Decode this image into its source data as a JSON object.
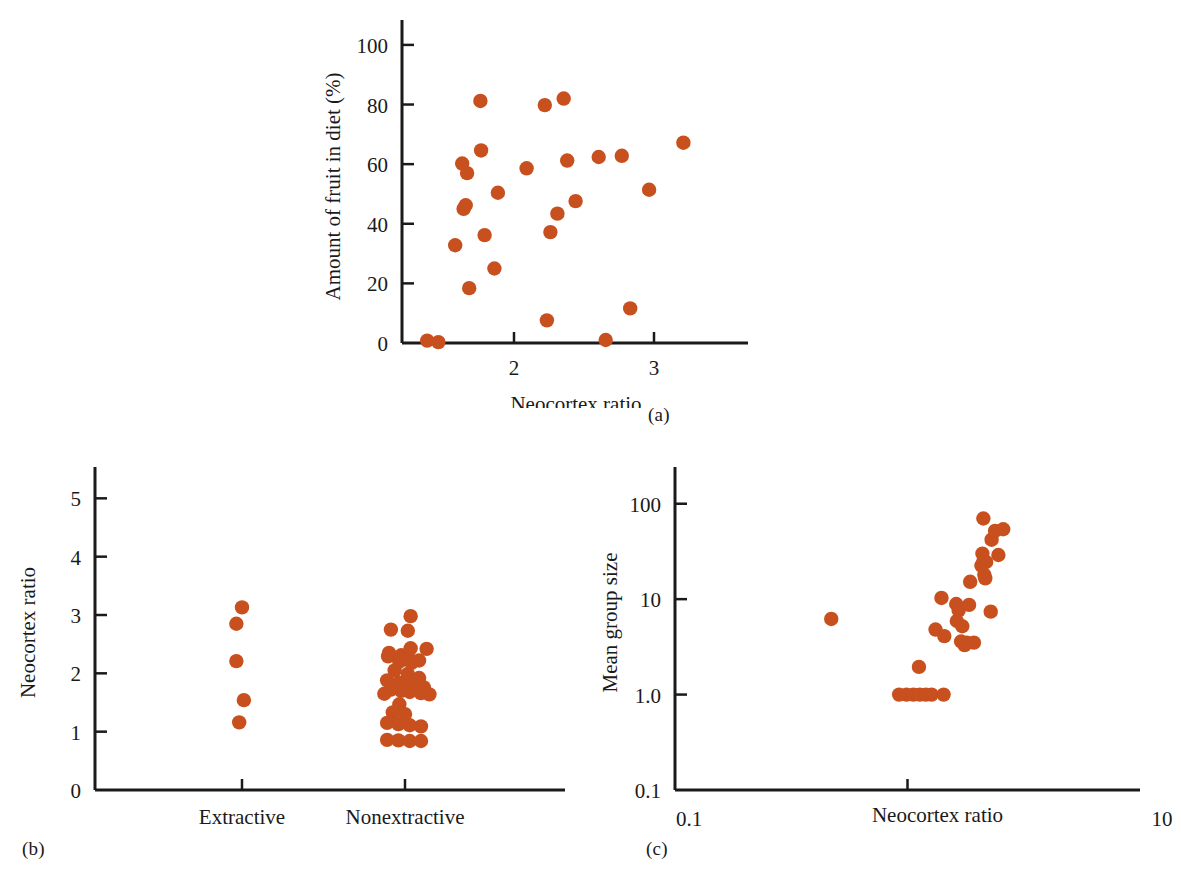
{
  "figure": {
    "marker_color": "#C8501E",
    "axis_color": "#1A1A1A",
    "background": "#FFFFFF",
    "panel_captions": {
      "a": "(a)",
      "b": "(b)",
      "c": "(c)"
    }
  },
  "chart_data": [
    {
      "panel": "(a)",
      "type": "scatter",
      "title": "",
      "xlabel": "Neocortex ratio",
      "ylabel": "Amount of fruit in diet (%)",
      "xlim": [
        1.2,
        3.4
      ],
      "ylim": [
        0,
        105
      ],
      "xticks": [
        2,
        3
      ],
      "xticklabels": [
        "2",
        "3"
      ],
      "yticks": [
        0,
        20,
        40,
        60,
        80,
        100
      ],
      "yticklabels": [
        "0",
        "20",
        "40",
        "60",
        "80",
        "100"
      ],
      "grid": false,
      "legend": "none",
      "points": [
        {
          "x": 1.38,
          "y": 0.8
        },
        {
          "x": 1.46,
          "y": 0.3
        },
        {
          "x": 1.58,
          "y": 32.8
        },
        {
          "x": 1.63,
          "y": 60.2
        },
        {
          "x": 1.64,
          "y": 45.0
        },
        {
          "x": 1.655,
          "y": 46.2
        },
        {
          "x": 1.665,
          "y": 57.0
        },
        {
          "x": 1.68,
          "y": 18.4
        },
        {
          "x": 1.76,
          "y": 81.2
        },
        {
          "x": 1.765,
          "y": 64.6
        },
        {
          "x": 1.79,
          "y": 36.2
        },
        {
          "x": 1.86,
          "y": 25.0
        },
        {
          "x": 1.885,
          "y": 50.4
        },
        {
          "x": 2.09,
          "y": 58.6
        },
        {
          "x": 2.22,
          "y": 79.8
        },
        {
          "x": 2.235,
          "y": 7.6
        },
        {
          "x": 2.26,
          "y": 37.2
        },
        {
          "x": 2.31,
          "y": 43.4
        },
        {
          "x": 2.355,
          "y": 82.0
        },
        {
          "x": 2.38,
          "y": 61.2
        },
        {
          "x": 2.44,
          "y": 47.6
        },
        {
          "x": 2.605,
          "y": 62.4
        },
        {
          "x": 2.655,
          "y": 1.0
        },
        {
          "x": 2.77,
          "y": 62.8
        },
        {
          "x": 2.83,
          "y": 11.6
        },
        {
          "x": 2.965,
          "y": 51.4
        },
        {
          "x": 3.21,
          "y": 67.2
        }
      ]
    },
    {
      "panel": "(b)",
      "type": "scatter",
      "title": "",
      "xlabel": "",
      "ylabel": "Neocortex ratio",
      "categories": [
        "Extractive",
        "Nonextractive"
      ],
      "ylim": [
        0,
        5.4
      ],
      "yticks": [
        0,
        1,
        2,
        3,
        4,
        5
      ],
      "yticklabels": [
        "0",
        "1",
        "2",
        "3",
        "4",
        "5"
      ],
      "grid": false,
      "legend": "none",
      "series": [
        {
          "name": "Extractive",
          "values": [
            3.13,
            2.85,
            2.21,
            1.54,
            1.16
          ],
          "offsets": [
            0.0,
            -0.012,
            -0.012,
            0.004,
            -0.006
          ]
        },
        {
          "name": "Nonextractive",
          "values": [
            2.98,
            2.75,
            2.73,
            2.43,
            2.42,
            2.35,
            2.31,
            2.29,
            2.26,
            2.22,
            2.2,
            2.18,
            2.05,
            1.99,
            1.92,
            1.88,
            1.84,
            1.8,
            1.76,
            1.72,
            1.7,
            1.68,
            1.66,
            1.65,
            1.64,
            1.47,
            1.33,
            1.3,
            1.15,
            1.13,
            1.11,
            1.09,
            0.86,
            0.85,
            0.84,
            0.84
          ],
          "offsets": [
            0.012,
            -0.03,
            0.006,
            0.012,
            0.046,
            -0.034,
            -0.008,
            -0.036,
            0.008,
            0.03,
            -0.012,
            0.014,
            -0.022,
            0.006,
            0.03,
            -0.038,
            -0.012,
            0.014,
            0.04,
            -0.03,
            -0.008,
            0.01,
            0.034,
            -0.044,
            0.052,
            -0.012,
            -0.026,
            0.0,
            -0.038,
            -0.014,
            0.01,
            0.034,
            -0.038,
            -0.014,
            0.01,
            0.034
          ]
        }
      ]
    },
    {
      "panel": "(c)",
      "type": "scatter",
      "title": "",
      "xlabel": "Neocortex ratio",
      "ylabel": "Mean group size",
      "xscale": "log",
      "yscale": "log",
      "xlim": [
        0.1,
        10
      ],
      "ylim": [
        0.1,
        200
      ],
      "xticks": [
        0.1,
        1,
        10
      ],
      "xticklabels": [
        "0.1",
        "",
        "10"
      ],
      "xtick_edge_labels": {
        "left": "0.1",
        "right": "10"
      },
      "yticks": [
        0.1,
        1.0,
        10,
        100
      ],
      "yticklabels": [
        "0.1",
        "1.0",
        "10",
        "100"
      ],
      "grid": false,
      "legend": "none",
      "points": [
        {
          "x": 0.47,
          "y": 6.2
        },
        {
          "x": 0.92,
          "y": 1.0
        },
        {
          "x": 0.99,
          "y": 1.0
        },
        {
          "x": 1.06,
          "y": 1.0
        },
        {
          "x": 1.13,
          "y": 1.0
        },
        {
          "x": 1.2,
          "y": 1.0
        },
        {
          "x": 1.27,
          "y": 1.0
        },
        {
          "x": 1.43,
          "y": 1.0
        },
        {
          "x": 1.12,
          "y": 1.95
        },
        {
          "x": 1.32,
          "y": 4.8
        },
        {
          "x": 1.4,
          "y": 10.3
        },
        {
          "x": 1.44,
          "y": 4.1
        },
        {
          "x": 1.62,
          "y": 8.9
        },
        {
          "x": 1.66,
          "y": 7.6
        },
        {
          "x": 1.63,
          "y": 5.9
        },
        {
          "x": 1.72,
          "y": 5.2
        },
        {
          "x": 1.7,
          "y": 3.6
        },
        {
          "x": 1.76,
          "y": 3.3
        },
        {
          "x": 1.8,
          "y": 3.5
        },
        {
          "x": 1.84,
          "y": 8.7
        },
        {
          "x": 1.93,
          "y": 3.5
        },
        {
          "x": 1.86,
          "y": 15.2
        },
        {
          "x": 2.08,
          "y": 22.5
        },
        {
          "x": 2.1,
          "y": 30.0
        },
        {
          "x": 2.12,
          "y": 25.0
        },
        {
          "x": 2.18,
          "y": 24.5
        },
        {
          "x": 2.14,
          "y": 18.0
        },
        {
          "x": 2.16,
          "y": 16.5
        },
        {
          "x": 2.12,
          "y": 70.0
        },
        {
          "x": 2.3,
          "y": 42.0
        },
        {
          "x": 2.38,
          "y": 52.0
        },
        {
          "x": 2.58,
          "y": 54.0
        },
        {
          "x": 2.46,
          "y": 29.0
        },
        {
          "x": 2.28,
          "y": 7.4
        }
      ]
    }
  ]
}
